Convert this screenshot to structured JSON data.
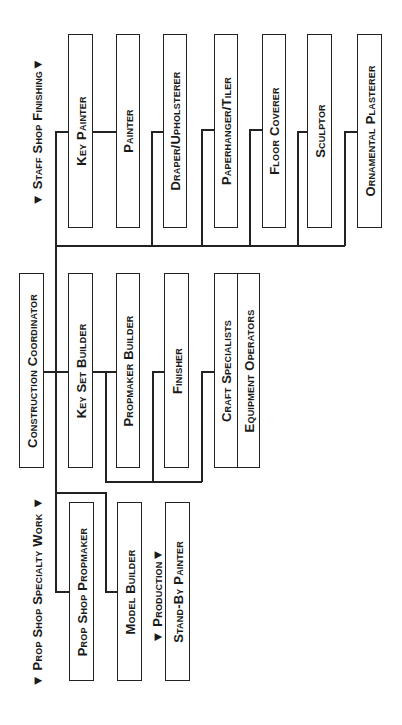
{
  "diagram": {
    "type": "org-chart",
    "orientation": "rotated-90-ccw",
    "line_color": "#222222",
    "root": {
      "label": "Construction Coordinator"
    },
    "section_labels": {
      "staff_shop": "▼ Staff Shop Finishing▼",
      "prop_shop": "▼ Prop Shop Specialty Work ▼",
      "production": "▼ Production▼"
    },
    "staff_shop_finishing": [
      {
        "label": "Key Painter"
      },
      {
        "label": "Painter"
      },
      {
        "label": "Draper/Upholsterer"
      },
      {
        "label": "Paperhanger/Tiler"
      },
      {
        "label": "Floor Coverer"
      },
      {
        "label": "Sculptor"
      },
      {
        "label": "Ornamental Plasterer"
      }
    ],
    "construction": [
      {
        "label": "Key Set Builder"
      },
      {
        "label": "Propmaker Builder"
      },
      {
        "label": "Finisher"
      },
      {
        "label": "Craft Specialists"
      },
      {
        "label": "Equipment Operators"
      }
    ],
    "prop_shop_specialty_work": [
      {
        "label": "Prop Shop Propmaker"
      },
      {
        "label": "Model Builder"
      }
    ],
    "production": [
      {
        "label": "Stand-By Painter"
      }
    ]
  }
}
